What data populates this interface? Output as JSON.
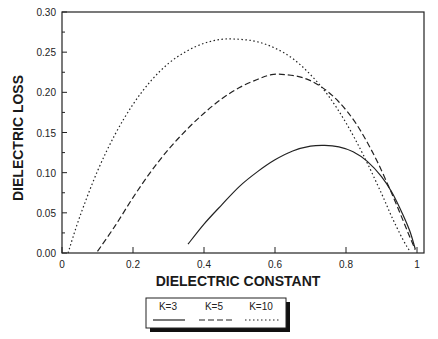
{
  "chart_data": {
    "type": "line",
    "title": "",
    "xlabel": "DIELECTRIC CONSTANT",
    "ylabel": "DIELECTRIC LOSS",
    "xlim": [
      0,
      1
    ],
    "ylim": [
      0,
      0.3
    ],
    "x_ticks": [
      "0",
      "0.2",
      "0.4",
      "0.6",
      "0.8",
      "1"
    ],
    "x_tick_values": [
      0,
      0.2,
      0.4,
      0.6,
      0.8,
      1.0
    ],
    "y_ticks": [
      "0.00",
      "0.05",
      "0.10",
      "0.15",
      "0.20",
      "0.25",
      "0.30"
    ],
    "y_tick_values": [
      0,
      0.05,
      0.1,
      0.15,
      0.2,
      0.25,
      0.3
    ],
    "grid": false,
    "legend_position": "bottom-center",
    "series": [
      {
        "name": "K=3",
        "style": "solid",
        "x": [
          0.355,
          0.4,
          0.45,
          0.5,
          0.55,
          0.6,
          0.65,
          0.7,
          0.74,
          0.78,
          0.82,
          0.86,
          0.9,
          0.93,
          0.96,
          0.98,
          0.995
        ],
        "y": [
          0.011,
          0.036,
          0.06,
          0.083,
          0.101,
          0.116,
          0.127,
          0.133,
          0.134,
          0.132,
          0.126,
          0.114,
          0.095,
          0.075,
          0.048,
          0.027,
          0.005
        ]
      },
      {
        "name": "K=5",
        "style": "dashed",
        "x": [
          0.1,
          0.15,
          0.2,
          0.25,
          0.3,
          0.35,
          0.4,
          0.45,
          0.5,
          0.55,
          0.59,
          0.63,
          0.68,
          0.73,
          0.78,
          0.83,
          0.88,
          0.92,
          0.95,
          0.975,
          0.995
        ],
        "y": [
          0.002,
          0.034,
          0.069,
          0.101,
          0.129,
          0.153,
          0.174,
          0.192,
          0.206,
          0.216,
          0.222,
          0.222,
          0.218,
          0.207,
          0.188,
          0.16,
          0.121,
          0.083,
          0.052,
          0.025,
          0.004
        ]
      },
      {
        "name": "K=10",
        "style": "dotted",
        "x": [
          0.017,
          0.05,
          0.1,
          0.15,
          0.2,
          0.25,
          0.3,
          0.35,
          0.4,
          0.45,
          0.5,
          0.55,
          0.6,
          0.65,
          0.7,
          0.75,
          0.8,
          0.85,
          0.9,
          0.93,
          0.96,
          0.98
        ],
        "y": [
          0.0,
          0.045,
          0.102,
          0.148,
          0.185,
          0.214,
          0.236,
          0.251,
          0.261,
          0.266,
          0.266,
          0.263,
          0.255,
          0.242,
          0.222,
          0.196,
          0.162,
          0.121,
          0.074,
          0.044,
          0.017,
          0.002
        ]
      }
    ]
  },
  "legend": {
    "items": [
      {
        "label": "K=3",
        "style": "solid"
      },
      {
        "label": "K=5",
        "style": "dashed"
      },
      {
        "label": "K=10",
        "style": "dotted"
      }
    ]
  },
  "colors": {
    "line": "#222222",
    "axis": "#222222",
    "background": "#ffffff"
  }
}
